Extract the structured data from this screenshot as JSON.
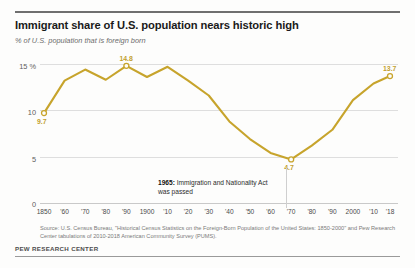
{
  "header": {
    "title": "Immigrant share of U.S. population nears historic high",
    "subtitle": "% of U.S. population that is foreign born"
  },
  "annotation": {
    "year": "1965:",
    "text": " Immigration and Nationality Act was passed"
  },
  "source": "Source: U.S. Census Bureau, \"Historical Census Statistics on the Foreign-Born Population of the United States: 1850-2000\" and Pew Research Center tabulations of 2010-2018 American Community Survey (PUMS).",
  "footer": "PEW RESEARCH CENTER",
  "colors": {
    "line": "#c7a42c",
    "label": "#c2a02e",
    "grid": "#dedede",
    "text": "#1a1a1a"
  },
  "chart_data": {
    "type": "line",
    "title": "Immigrant share of U.S. population nears historic high",
    "subtitle": "% of U.S. population that is foreign born",
    "xlabel": "",
    "ylabel": "% of U.S. population that is foreign born",
    "ylim": [
      0,
      15
    ],
    "yticks": [
      0,
      5,
      10,
      15
    ],
    "ytick_labels": [
      "0",
      "5",
      "10",
      "15 %"
    ],
    "grid": true,
    "legend": null,
    "x": [
      1850,
      1860,
      1870,
      1880,
      1890,
      1900,
      1910,
      1920,
      1930,
      1940,
      1950,
      1960,
      1970,
      1980,
      1990,
      2000,
      2010,
      2018
    ],
    "xtick_labels": [
      "1850",
      "'60",
      "'70",
      "'80",
      "'90",
      "1900",
      "'10",
      "'20",
      "'30",
      "'40",
      "'50",
      "'60",
      "'70",
      "'80",
      "'90",
      "2000",
      "'10",
      "'18"
    ],
    "values": [
      9.7,
      13.2,
      14.4,
      13.3,
      14.8,
      13.6,
      14.7,
      13.2,
      11.6,
      8.8,
      6.9,
      5.4,
      4.7,
      6.2,
      7.9,
      11.1,
      12.9,
      13.7
    ],
    "point_labels": [
      {
        "x": 1850,
        "value": 9.7,
        "label": "9.7",
        "position": "below"
      },
      {
        "x": 1890,
        "value": 14.8,
        "label": "14.8",
        "position": "above"
      },
      {
        "x": 1970,
        "value": 4.7,
        "label": "4.7",
        "position": "below"
      },
      {
        "x": 2018,
        "value": 13.7,
        "label": "13.7",
        "position": "above"
      }
    ],
    "annotations": [
      {
        "x": 1965,
        "text": "1965: Immigration and Nationality Act was passed"
      }
    ]
  }
}
